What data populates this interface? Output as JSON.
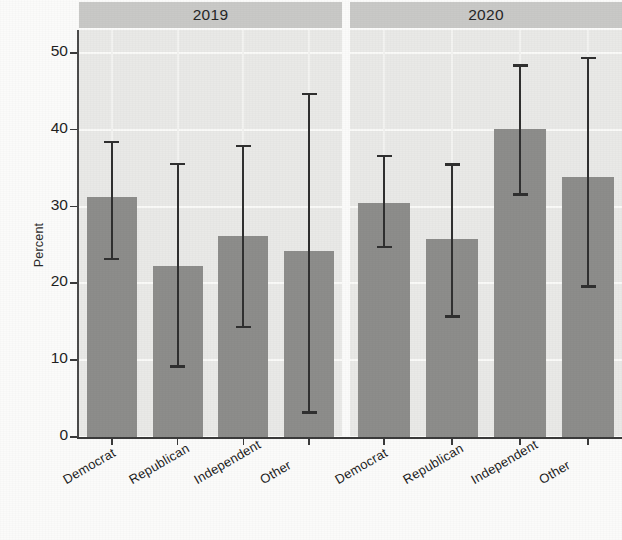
{
  "figure": {
    "clipped_top_text": "",
    "background_color": "#fbfbfa",
    "panel_background_color": "#e9e9e7",
    "bar_color": "#8d8d8b",
    "error_bar_color": "#303030",
    "strip_color": "#c9c9c7",
    "gridline_color": "#fafaf8"
  },
  "chart_data": {
    "type": "bar",
    "title": "",
    "xlabel": "",
    "ylabel": "Percent",
    "ylim": [
      0,
      53
    ],
    "yticks": [
      0,
      10,
      20,
      30,
      40,
      50
    ],
    "ytick_labels": [
      "0",
      "10",
      "20",
      "30",
      "40",
      "50"
    ],
    "grid": true,
    "legend": "none",
    "facet_variable": "year",
    "facets": [
      "2019",
      "2020"
    ],
    "categories": [
      "Democrat",
      "Republican",
      "Independent",
      "Other"
    ],
    "error_bars": "95% confidence interval",
    "series": [
      {
        "name": "2019",
        "values": [
          31.3,
          22.3,
          26.2,
          24.2
        ],
        "ci_low": [
          23.2,
          9.2,
          14.3,
          3.2
        ],
        "ci_high": [
          38.4,
          35.6,
          37.9,
          44.7
        ]
      },
      {
        "name": "2020",
        "values": [
          30.5,
          25.8,
          40.1,
          33.8
        ],
        "ci_low": [
          24.8,
          15.7,
          31.6,
          19.6
        ],
        "ci_high": [
          36.6,
          35.5,
          48.4,
          49.4
        ]
      }
    ]
  }
}
